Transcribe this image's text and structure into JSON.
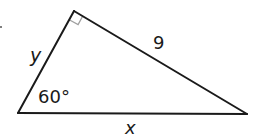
{
  "diagram": {
    "type": "right-triangle",
    "vertices": {
      "top": [
        74,
        11
      ],
      "bottom_left": [
        18,
        113
      ],
      "bottom_right": [
        247,
        114
      ]
    },
    "labels": {
      "side_left": "y",
      "hypotenuse_side": "9",
      "angle_bottom_left": "60°",
      "side_bottom": "x"
    },
    "right_angle_marker": true,
    "colors": {
      "stroke": "#1a1a1a",
      "marker": "#a0a0a0",
      "background": "#ffffff"
    }
  }
}
